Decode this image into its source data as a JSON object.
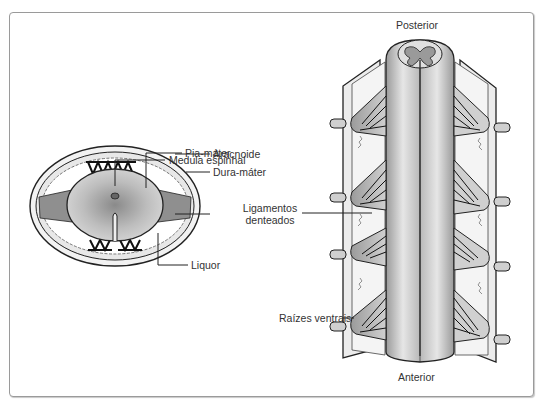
{
  "figure": {
    "left_panel": {
      "title": "",
      "labels": {
        "medula_espinhal": "Medula espinhal",
        "pia_mater": "Pia-máter",
        "aracnoide": "Aracnoide",
        "dura_mater": "Dura-máter",
        "ligamentos_denteados_line1": "Ligamentos",
        "ligamentos_denteados_line2": "denteados",
        "liquor": "Liquor"
      }
    },
    "right_panel": {
      "orientation_top": "Posterior",
      "orientation_bottom": "Anterior",
      "labels": {
        "raizes_ventrais": "Raízes ventrais"
      }
    },
    "colors": {
      "outline": "#222222",
      "membrane_fill": "#e8e8e8",
      "cord_gray": "#b5b5b5",
      "ligament_gray": "#8c8c8c",
      "frame_border": "#9a9a9a",
      "label_text": "#333333"
    }
  }
}
